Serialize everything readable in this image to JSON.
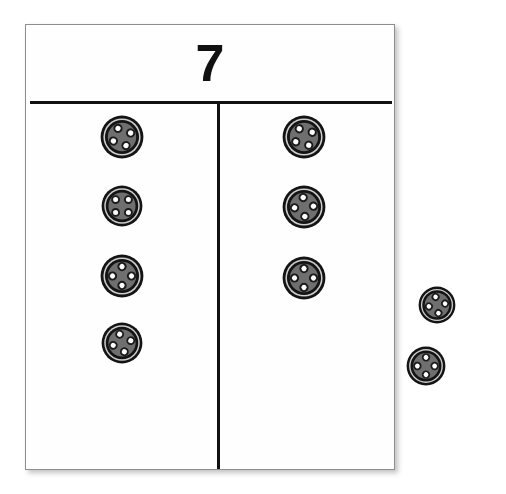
{
  "page": {
    "background_color": "#ffffff",
    "width": 506,
    "height": 494
  },
  "mat": {
    "whole_label": "7",
    "whole_value": 7,
    "border_color": "#8e8e8e",
    "rule_color": "#111111",
    "fill_color": "#fefefe",
    "has_horizontal_rule": true,
    "has_vertical_rule": true
  },
  "counters": {
    "kind": "button",
    "outer_ring_color": "#141414",
    "gap_color": "#cfcfcf",
    "inner_ring_color": "#141414",
    "face_color": "#6f6f6f",
    "hole_color": "#fdfdfd",
    "hole_count_each": 4,
    "total_visible": 9
  },
  "parts": {
    "left": {
      "name": "part-left",
      "count": 4,
      "tokens": [
        {
          "label": "button",
          "size": 44,
          "rotation": 20
        },
        {
          "label": "button",
          "size": 42,
          "rotation": 0
        },
        {
          "label": "button",
          "size": 44,
          "rotation": 45
        },
        {
          "label": "button",
          "size": 42,
          "rotation": 30
        }
      ]
    },
    "right": {
      "name": "part-right",
      "count": 3,
      "tokens": [
        {
          "label": "button",
          "size": 44,
          "rotation": 15
        },
        {
          "label": "button",
          "size": 44,
          "rotation": 40
        },
        {
          "label": "button",
          "size": 44,
          "rotation": 45
        }
      ]
    }
  },
  "loose": {
    "name": "loose-buttons",
    "count": 2,
    "tokens": [
      {
        "label": "button",
        "size": 38,
        "rotation": 35
      },
      {
        "label": "button",
        "size": 40,
        "rotation": 45
      }
    ]
  }
}
